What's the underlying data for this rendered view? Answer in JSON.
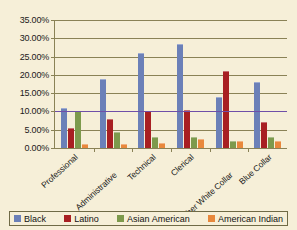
{
  "chart_data": {
    "type": "bar",
    "title": "",
    "subtitle": "",
    "xlabel": "",
    "ylabel": "",
    "ylim": [
      0,
      35
    ],
    "grid": true,
    "legend_position": "bottom",
    "y_tick_labels": [
      "35.00%",
      "30.00%",
      "25.00%",
      "20.00%",
      "15.00%",
      "10.00%",
      "5.00%",
      "0.00%"
    ],
    "y_ticks": [
      35,
      30,
      25,
      20,
      15,
      10,
      5,
      0
    ],
    "categories": [
      "Professional",
      "Administrative",
      "Technical",
      "Clerical",
      "Other White Collar",
      "Blue Collar"
    ],
    "series": [
      {
        "name": "Black",
        "color": "#6b80b8",
        "values": [
          11.0,
          19.0,
          26.0,
          28.5,
          14.0,
          18.0
        ]
      },
      {
        "name": "Latino",
        "color": "#a81f22",
        "values": [
          5.5,
          8.0,
          10.0,
          10.5,
          21.0,
          7.0
        ]
      },
      {
        "name": "Asian American",
        "color": "#7d9a4c",
        "values": [
          10.0,
          4.5,
          3.0,
          3.0,
          2.0,
          3.0
        ]
      },
      {
        "name": "American Indian",
        "color": "#e8883c",
        "values": [
          1.0,
          1.0,
          1.5,
          2.5,
          2.0,
          2.0
        ]
      }
    ]
  },
  "colors": {
    "background": "#f6efd8",
    "axis": "#8a8256",
    "grid": "#8a8256",
    "accent_line": "#6f4fa8",
    "text": "#1a1a1a"
  }
}
